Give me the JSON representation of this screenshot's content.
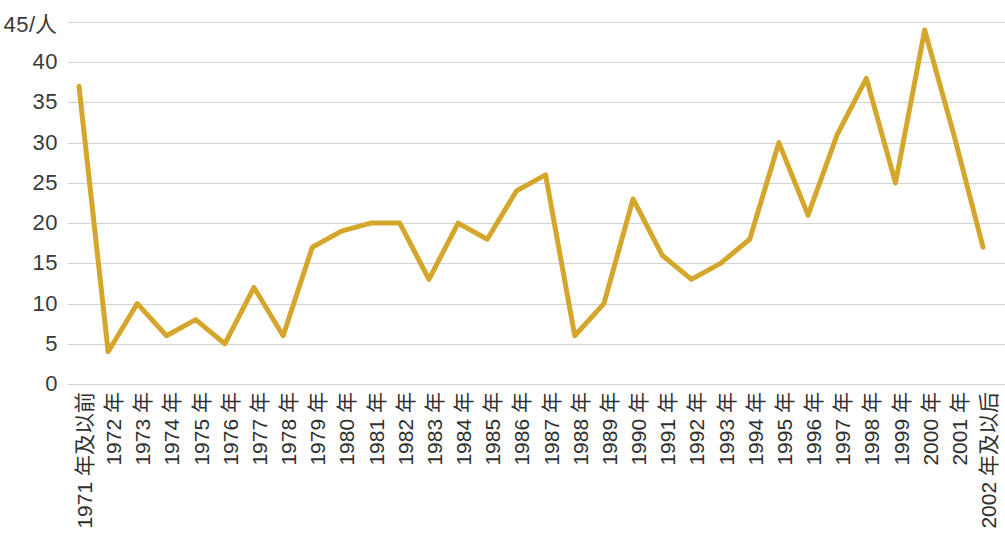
{
  "chart_data": {
    "type": "line",
    "title": "",
    "subtitle": "",
    "xlabel": "",
    "ylabel": "45/人",
    "ylim": [
      0,
      45
    ],
    "grid": true,
    "legend": "none",
    "y_ticks": [
      0,
      5,
      10,
      15,
      20,
      25,
      30,
      35,
      40,
      45
    ],
    "y_tick_labels": [
      "0",
      "5",
      "10",
      "15",
      "20",
      "25",
      "30",
      "35",
      "40",
      "45/人"
    ],
    "categories": [
      "1971 年及以前",
      "1972 年",
      "1973 年",
      "1974 年",
      "1975 年",
      "1976 年",
      "1977 年",
      "1978 年",
      "1979 年",
      "1980 年",
      "1981 年",
      "1982 年",
      "1983 年",
      "1984 年",
      "1985 年",
      "1986 年",
      "1987 年",
      "1988 年",
      "1989 年",
      "1990 年",
      "1991 年",
      "1992 年",
      "1993 年",
      "1994 年",
      "1995 年",
      "1996 年",
      "1997 年",
      "1998 年",
      "1999 年",
      "2000 年",
      "2001 年",
      "2002 年及以后"
    ],
    "values": [
      37,
      4,
      10,
      6,
      8,
      5,
      12,
      6,
      17,
      19,
      20,
      20,
      13,
      20,
      18,
      24,
      26,
      6,
      10,
      23,
      16,
      13,
      15,
      18,
      30,
      21,
      31,
      38,
      25,
      44,
      31,
      17
    ],
    "series": [
      {
        "name": "人数",
        "color": "#D4A72C",
        "values": [
          37,
          4,
          10,
          6,
          8,
          5,
          12,
          6,
          17,
          19,
          20,
          20,
          13,
          20,
          18,
          24,
          26,
          6,
          10,
          23,
          16,
          13,
          15,
          18,
          30,
          21,
          31,
          38,
          25,
          44,
          31,
          17
        ]
      }
    ]
  },
  "colors": {
    "line": "#D4A72C",
    "gridline": "#d0d3d8",
    "tick_text": "#2f2f2f",
    "background": "#ffffff"
  }
}
